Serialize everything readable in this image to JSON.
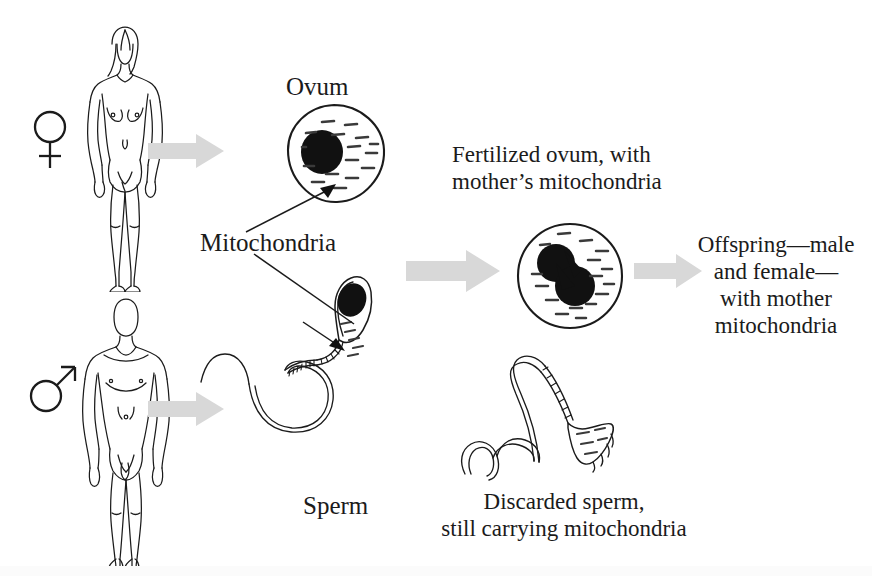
{
  "figure": {
    "background_color": "#ffffff",
    "ink_color": "#1b1b1b",
    "arrow_color": "#d6d6d6"
  },
  "symbols": {
    "female": "venus-symbol",
    "male": "mars-symbol"
  },
  "labels": {
    "ovum": "Ovum",
    "mitochondria": "Mitochondria",
    "sperm": "Sperm",
    "fertilized_ovum": {
      "line1": "Fertilized ovum, with",
      "line2": "mother’s mitochondria"
    },
    "offspring": {
      "line1": "Offspring—male",
      "line2": "and female—",
      "line3": "with mother",
      "line4": "mitochondria"
    },
    "discarded_sperm": {
      "line1": "Discarded sperm,",
      "line2": "still carrying mitochondria"
    }
  },
  "elements": {
    "female_figure": "female-body-outline",
    "male_figure": "male-body-outline",
    "ovum_cell": "ovum-cell",
    "fertilized_cell": "fertilized-ovum-cell",
    "sperm_cell": "sperm-cell",
    "discarded_sperm_cell": "discarded-sperm-cell",
    "arrow_female": "arrow-right",
    "arrow_male": "arrow-right",
    "arrow_fertilize": "arrow-right",
    "arrow_offspring": "arrow-right",
    "pointer_ovum": "leader-line-arrow",
    "pointer_sperm": "leader-line-arrow"
  }
}
